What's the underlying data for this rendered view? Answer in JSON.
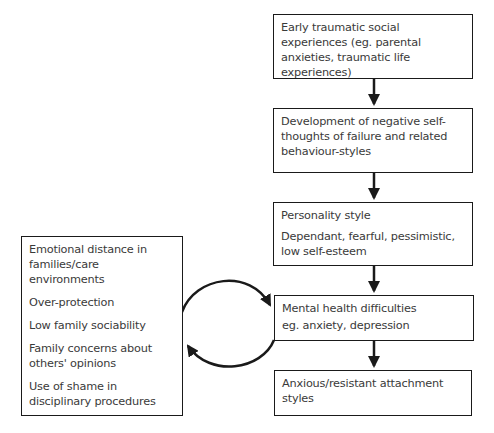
{
  "diagram": {
    "chain": [
      {
        "id": "early",
        "lines": [
          "Early traumatic social experiences (eg. parental anxieties, traumatic life experiences)"
        ]
      },
      {
        "id": "development",
        "lines": [
          "Development of negative self-thoughts of failure and related behaviour-styles"
        ]
      },
      {
        "id": "personality",
        "lines": [
          "Personality style",
          "Dependant, fearful, pessimistic, low self-esteem"
        ]
      },
      {
        "id": "mental-health",
        "lines": [
          "Mental health difficulties",
          "eg. anxiety, depression"
        ]
      },
      {
        "id": "attachment",
        "lines": [
          "Anxious/resistant attachment styles"
        ]
      }
    ],
    "family_factors": [
      "Emotional distance in families/care environments",
      "Over-protection",
      "Low family sociability",
      "Family concerns about others' opinions",
      "Use of shame in disciplinary procedures"
    ],
    "connections": [
      {
        "from": "early",
        "to": "development",
        "type": "arrow"
      },
      {
        "from": "development",
        "to": "personality",
        "type": "arrow"
      },
      {
        "from": "personality",
        "to": "mental-health",
        "type": "arrow"
      },
      {
        "from": "mental-health",
        "to": "attachment",
        "type": "arrow"
      },
      {
        "from": "family-factors",
        "to": "mental-health",
        "type": "curved-arrow"
      },
      {
        "from": "mental-health",
        "to": "family-factors",
        "type": "curved-arrow"
      }
    ],
    "colors": {
      "line": "#1a1a1a",
      "text": "#3a3a3a",
      "background": "#ffffff"
    }
  }
}
